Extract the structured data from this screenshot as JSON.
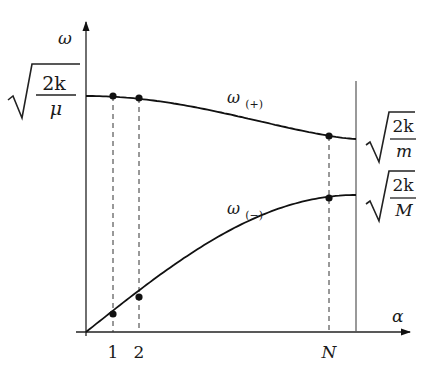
{
  "diagram": {
    "axes": {
      "y_label": "ω",
      "x_label": "α"
    },
    "x_ticks": [
      "1",
      "2",
      "N"
    ],
    "branches": [
      {
        "name": "upper",
        "label_base": "ω",
        "label_sub": "(+)"
      },
      {
        "name": "lower",
        "label_base": "ω",
        "label_sub": "(−)"
      }
    ],
    "levels": {
      "top": {
        "num": "2k",
        "den": "μ"
      },
      "upper_end": {
        "num": "2k",
        "den": "m"
      },
      "lower_end": {
        "num": "2k",
        "den": "M"
      }
    },
    "marked_points_index": [
      1,
      2,
      "N"
    ]
  }
}
